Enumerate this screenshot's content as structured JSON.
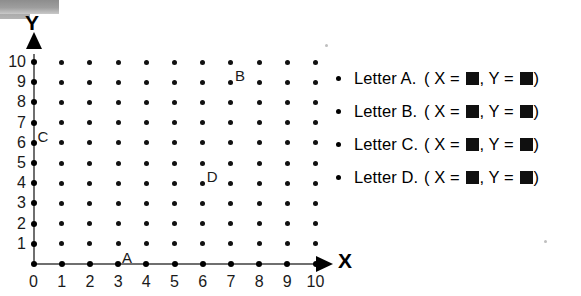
{
  "axes": {
    "x_label": "X",
    "y_label": "Y",
    "x_ticks": [
      "0",
      "1",
      "2",
      "3",
      "4",
      "5",
      "6",
      "7",
      "8",
      "9",
      "10"
    ],
    "y_ticks": [
      "0",
      "1",
      "2",
      "3",
      "4",
      "5",
      "6",
      "7",
      "8",
      "9",
      "10"
    ],
    "x_min": 0,
    "x_max": 10,
    "y_min": 0,
    "y_max": 10
  },
  "plotted_points": [
    {
      "label": "A",
      "x": 3,
      "y": 0
    },
    {
      "label": "B",
      "x": 7,
      "y": 9
    },
    {
      "label": "C",
      "x": 0,
      "y": 6
    },
    {
      "label": "D",
      "x": 6,
      "y": 4
    }
  ],
  "legend": {
    "rows": [
      {
        "name": "Letter A.",
        "open": "( ",
        "x_var": "X = ",
        "x_value": "",
        "sep": ", ",
        "y_var": "Y = ",
        "y_value": "",
        "close": ")"
      },
      {
        "name": "Letter B.",
        "open": "( ",
        "x_var": "X = ",
        "x_value": "",
        "sep": ", ",
        "y_var": "Y = ",
        "y_value": "",
        "close": ")"
      },
      {
        "name": "Letter C.",
        "open": "( ",
        "x_var": "X = ",
        "x_value": "",
        "sep": ", ",
        "y_var": "Y = ",
        "y_value": "",
        "close": ")"
      },
      {
        "name": "Letter D.",
        "open": "( ",
        "x_var": "X = ",
        "x_value": "",
        "sep": ", ",
        "y_var": "Y = ",
        "y_value": "",
        "close": ")"
      }
    ]
  },
  "colors": {
    "ink": "#000000",
    "axis": "#6f6f6f",
    "artifact": "#9e9e9e"
  },
  "chart_data": {
    "type": "scatter",
    "title": "",
    "xlabel": "X",
    "ylabel": "Y",
    "xlim": [
      0,
      10
    ],
    "ylim": [
      0,
      10
    ],
    "grid": true,
    "series": [
      {
        "name": "labeled points",
        "points": [
          {
            "label": "A",
            "x": 3,
            "y": 0
          },
          {
            "label": "B",
            "x": 7,
            "y": 9
          },
          {
            "label": "C",
            "x": 0,
            "y": 6
          },
          {
            "label": "D",
            "x": 6,
            "y": 4
          }
        ]
      }
    ]
  }
}
